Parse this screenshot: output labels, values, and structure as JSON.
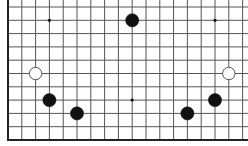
{
  "board": {
    "type": "go-board-partial",
    "colors": {
      "background": "#ffffff",
      "grid_line": "#555555",
      "edge_line": "#222222",
      "black_stone": "#111111",
      "white_stone_fill": "#ffffff",
      "white_stone_stroke": "#555555",
      "hoshi": "#111111"
    },
    "grid": {
      "origin_x": 8,
      "origin_y": 7,
      "col_spacing": 13.8,
      "row_spacing": 13.3,
      "cols": 18,
      "rows": 11,
      "visible_edges": [
        "left",
        "bottom"
      ]
    },
    "hoshi": [
      {
        "col": 3,
        "row": 1
      },
      {
        "col": 15,
        "row": 1
      },
      {
        "col": 9,
        "row": 7
      }
    ],
    "stones": [
      {
        "color": "black",
        "col": 9,
        "row": 1
      },
      {
        "color": "white",
        "col": 2,
        "row": 5
      },
      {
        "color": "white",
        "col": 16,
        "row": 5
      },
      {
        "color": "black",
        "col": 3,
        "row": 7
      },
      {
        "color": "black",
        "col": 15,
        "row": 7
      },
      {
        "color": "black",
        "col": 5,
        "row": 8
      },
      {
        "color": "black",
        "col": 13,
        "row": 8
      }
    ]
  }
}
